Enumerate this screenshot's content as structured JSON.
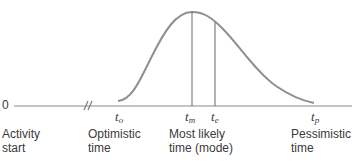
{
  "diagram": {
    "type": "beta-distribution-time-estimate",
    "zero_label": "0",
    "ticks": {
      "optimistic": {
        "base": "t",
        "sub": "o"
      },
      "most_likely": {
        "base": "t",
        "sub": "m"
      },
      "expected": {
        "base": "t",
        "sub": "e"
      },
      "pessimistic": {
        "base": "t",
        "sub": "p"
      }
    },
    "labels": {
      "activity_start": [
        "Activity",
        "start"
      ],
      "optimistic": [
        "Optimistic",
        "time"
      ],
      "most_likely": [
        "Most likely",
        "time (mode)"
      ],
      "pessimistic": [
        "Pessimistic",
        "time"
      ]
    },
    "colors": {
      "line": "#8a8a8a",
      "curve": "#8f8f8f",
      "text": "#3a3a3a"
    }
  }
}
